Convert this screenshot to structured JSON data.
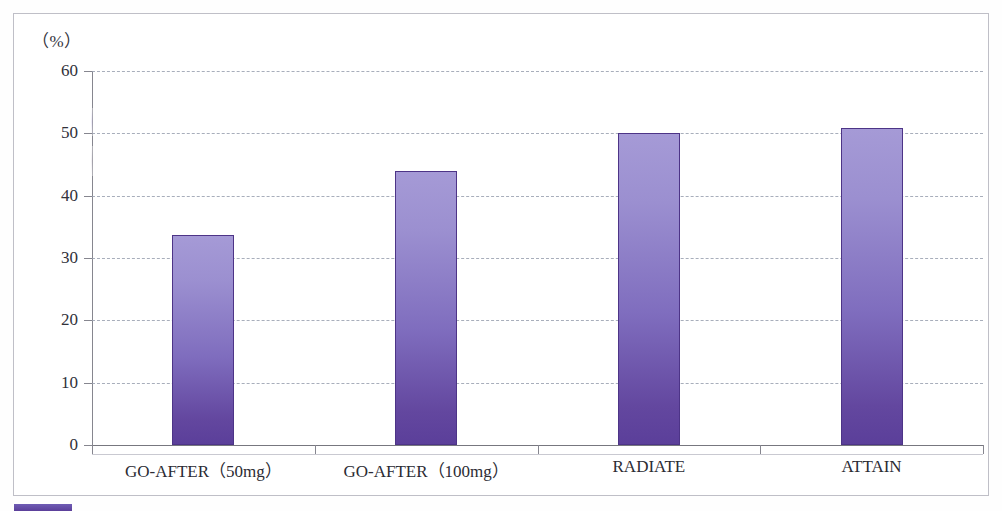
{
  "chart_data": {
    "type": "bar",
    "title": "",
    "subtitle": "",
    "xlabel": "",
    "ylabel": "",
    "unit_label": "（%）",
    "ylim": [
      0,
      60
    ],
    "ytick_values": [
      0,
      10,
      20,
      30,
      40,
      50,
      60
    ],
    "ytick_labels": [
      "0",
      "10",
      "20",
      "30",
      "40",
      "50",
      "60"
    ],
    "grid": true,
    "grid_style": "dashed-horizontal",
    "legend": "none",
    "categories": [
      "GO-AFTER（50mg）",
      "GO-AFTER（100mg）",
      "RADIATE",
      "ATTAIN"
    ],
    "values": [
      33.7,
      44.0,
      50.1,
      50.9
    ],
    "series": [
      {
        "name": "",
        "values": [
          33.7,
          44.0,
          50.1,
          50.9
        ]
      }
    ],
    "bar_color_top": "#a59ad6",
    "bar_color_bottom": "#5b3f9a",
    "bar_border_color": "#4d3487",
    "axis_color": "#86868f",
    "gridline_color": "#9aa0b0",
    "frame_color": "#bfbfc7"
  },
  "caption": {
    "swatch_color": "#5b3f9a",
    "text": ""
  }
}
